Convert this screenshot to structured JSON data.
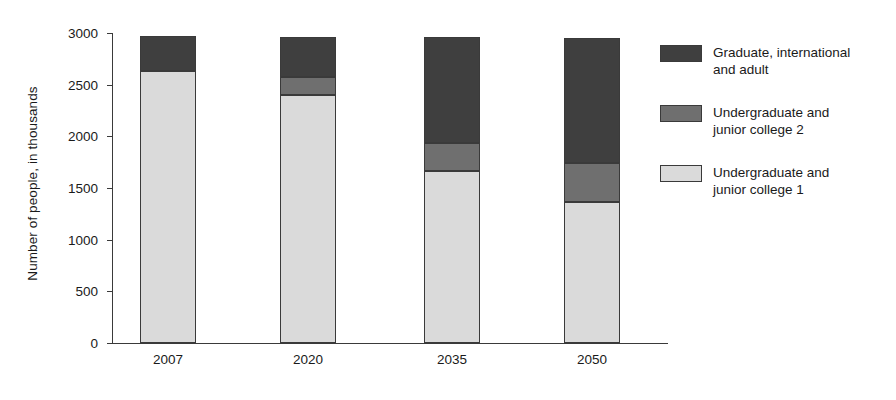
{
  "chart_data": {
    "type": "bar",
    "subtype": "stacked-vertical",
    "title": "",
    "xlabel": "",
    "ylabel": "Number of people, in thousands",
    "categories": [
      "2007",
      "2020",
      "2035",
      "2050"
    ],
    "ylim": [
      0,
      3000
    ],
    "yticks": [
      0,
      500,
      1000,
      1500,
      2000,
      2500,
      3000
    ],
    "ytick_labels": [
      "0",
      "500",
      "1000",
      "1500",
      "2000",
      "2500",
      "3000"
    ],
    "grid": false,
    "legend_position": "right",
    "series": [
      {
        "name": "Undergraduate and\njunior college 1",
        "color": "#dadada",
        "values": [
          2630,
          2400,
          1660,
          1365
        ]
      },
      {
        "name": "Undergraduate and\njunior college 2",
        "color": "#6f6f6f",
        "values": [
          0,
          170,
          275,
          380
        ]
      },
      {
        "name": "Graduate, international\nand adult",
        "color": "#3f3f3f",
        "values": [
          340,
          395,
          1025,
          1210
        ]
      }
    ],
    "totals": [
      2970,
      2965,
      2960,
      2955
    ]
  },
  "legend": {
    "items": [
      {
        "label": "Graduate, international\nand adult",
        "swatch": "dark",
        "color": "#3f3f3f"
      },
      {
        "label": "Undergraduate and\njunior college 2",
        "swatch": "mid",
        "color": "#6f6f6f"
      },
      {
        "label": "Undergraduate and\njunior college 1",
        "swatch": "light",
        "color": "#dadada"
      }
    ]
  },
  "axis": {
    "y_title": "Number of people, in thousands"
  }
}
